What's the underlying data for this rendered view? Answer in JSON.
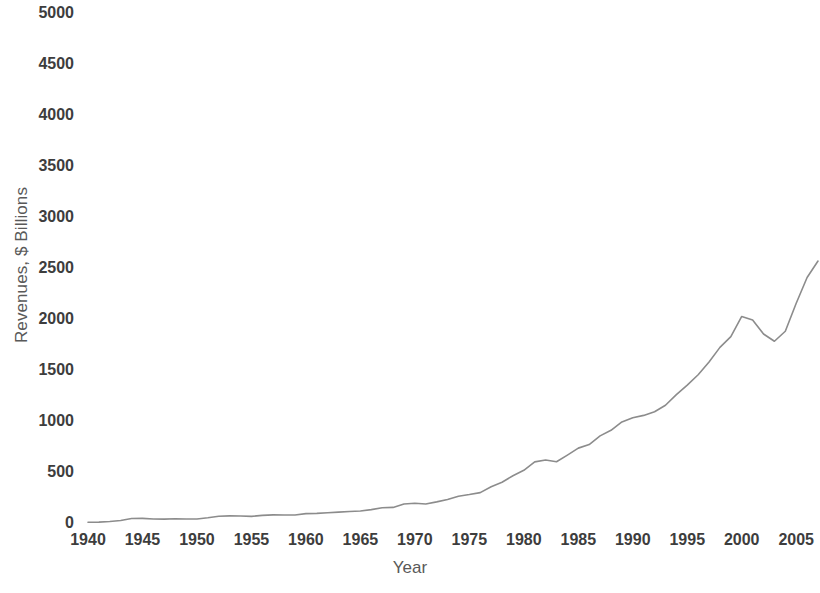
{
  "chart_data": {
    "type": "line",
    "title": "",
    "xlabel": "Year",
    "ylabel": "Revenues, $ Billions",
    "xlim": [
      1940,
      2007
    ],
    "ylim": [
      0,
      5000
    ],
    "grid": false,
    "legend": false,
    "legend_position": "none",
    "line_color": "#8c8c8c",
    "line_width": 1.6,
    "x_tick_labels": [
      "1940",
      "1945",
      "1950",
      "1955",
      "1960",
      "1965",
      "1970",
      "1975",
      "1980",
      "1985",
      "1990",
      "1995",
      "2000",
      "2005"
    ],
    "x_tick_values": [
      1940,
      1945,
      1950,
      1955,
      1960,
      1965,
      1970,
      1975,
      1980,
      1985,
      1990,
      1995,
      2000,
      2005
    ],
    "y_tick_labels": [
      "0",
      "500",
      "1000",
      "1500",
      "2000",
      "2500",
      "3000",
      "3500",
      "4000",
      "4500",
      "5000"
    ],
    "y_tick_values": [
      0,
      500,
      1000,
      1500,
      2000,
      2500,
      3000,
      3500,
      4000,
      4500,
      5000
    ],
    "series": [
      {
        "name": "Revenues",
        "x": [
          1940,
          1941,
          1942,
          1943,
          1944,
          1945,
          1946,
          1947,
          1948,
          1949,
          1950,
          1951,
          1952,
          1953,
          1954,
          1955,
          1956,
          1957,
          1958,
          1959,
          1960,
          1961,
          1962,
          1963,
          1964,
          1965,
          1966,
          1967,
          1968,
          1969,
          1970,
          1971,
          1972,
          1973,
          1974,
          1975,
          1976,
          1977,
          1978,
          1979,
          1980,
          1981,
          1982,
          1983,
          1984,
          1985,
          1986,
          1987,
          1988,
          1989,
          1990,
          1991,
          1992,
          1993,
          1994,
          1995,
          1996,
          1997,
          1998,
          1999,
          2000,
          2001,
          2002,
          2003,
          2004,
          2005,
          2006,
          2007
        ],
        "values": [
          7,
          9,
          15,
          25,
          44,
          45,
          39,
          38,
          42,
          39,
          39,
          51,
          66,
          70,
          69,
          65,
          75,
          80,
          79,
          79,
          92,
          94,
          100,
          107,
          113,
          117,
          131,
          149,
          153,
          187,
          193,
          187,
          207,
          231,
          263,
          279,
          298,
          356,
          400,
          463,
          517,
          599,
          618,
          601,
          666,
          734,
          769,
          854,
          909,
          991,
          1032,
          1055,
          1091,
          1154,
          1259,
          1352,
          1453,
          1579,
          1722,
          1827,
          2025,
          1991,
          1853,
          1782,
          1880,
          2154,
          2407,
          2568
        ]
      }
    ]
  },
  "axes": {
    "y_title": "Revenues, $ Billions",
    "x_title": "Year"
  }
}
